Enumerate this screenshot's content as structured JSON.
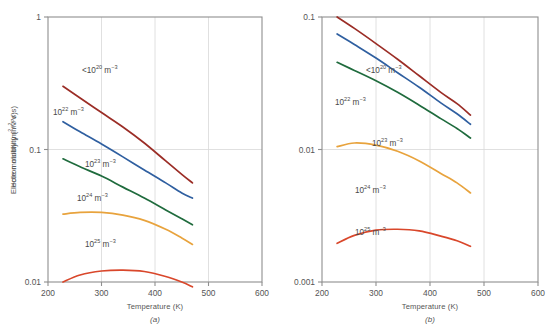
{
  "figure": {
    "panels": [
      {
        "id": "a",
        "caption": "(a)",
        "ylabel": "Electron mobility (m2/V·s)",
        "xlabel": "Temperature (K)"
      },
      {
        "id": "b",
        "caption": "(b)",
        "ylabel": "Hole mobility (m2/V·s)",
        "xlabel": "Temperature (K)"
      }
    ]
  },
  "chart_data": [
    {
      "type": "line",
      "panel": "a",
      "title": "Electron mobility vs Temperature",
      "xlabel": "Temperature (K)",
      "ylabel": "Electron mobility (m2/V·s)",
      "xlim": [
        200,
        600
      ],
      "ylim": [
        0.01,
        1
      ],
      "yscale": "log",
      "xticks": [
        200,
        300,
        400,
        500,
        600
      ],
      "xtick_labels": [
        "200",
        "300",
        "400",
        "500",
        "600"
      ],
      "yticks": [
        0.01,
        0.1,
        1
      ],
      "ytick_labels": [
        "0.01",
        "0.1",
        "1"
      ],
      "grid": true,
      "legend": "inline-annotations",
      "series": [
        {
          "name": "<10^20 m^-3",
          "label_html": "&lt;10<sup>20</sup> m<sup>−3</sup>",
          "color": "#9b2d26",
          "x": [
            228,
            260,
            300,
            340,
            380,
            420,
            450,
            470
          ],
          "y": [
            0.3,
            0.245,
            0.19,
            0.148,
            0.112,
            0.082,
            0.065,
            0.056
          ]
        },
        {
          "name": "10^22 m^-3",
          "label_html": "10<sup>22</sup> m<sup>−3</sup>",
          "color": "#2f5fa0",
          "x": [
            228,
            260,
            300,
            340,
            380,
            420,
            450,
            470
          ],
          "y": [
            0.162,
            0.136,
            0.11,
            0.088,
            0.07,
            0.056,
            0.047,
            0.043
          ]
        },
        {
          "name": "10^23 m^-3",
          "label_html": "10<sup>23</sup> m<sup>−3</sup>",
          "color": "#1f6b3d",
          "x": [
            228,
            260,
            300,
            340,
            380,
            420,
            450,
            470
          ],
          "y": [
            0.085,
            0.074,
            0.063,
            0.052,
            0.043,
            0.035,
            0.03,
            0.027
          ]
        },
        {
          "name": "10^24 m^-3",
          "label_html": "10<sup>24</sup> m<sup>−3</sup>",
          "color": "#e8a33d",
          "x": [
            228,
            260,
            300,
            340,
            380,
            420,
            450,
            470
          ],
          "y": [
            0.0325,
            0.0335,
            0.0335,
            0.032,
            0.0292,
            0.025,
            0.0215,
            0.0192
          ]
        },
        {
          "name": "10^25 m^-3",
          "label_html": "10<sup>25</sup> m<sup>−3</sup>",
          "color": "#d9472b",
          "x": [
            228,
            260,
            300,
            340,
            380,
            420,
            450,
            470
          ],
          "y": [
            0.01,
            0.0113,
            0.0121,
            0.0123,
            0.012,
            0.011,
            0.01,
            0.0092
          ]
        }
      ]
    },
    {
      "type": "line",
      "panel": "b",
      "title": "Hole mobility vs Temperature",
      "xlabel": "Temperature (K)",
      "ylabel": "Hole mobility (m2/V·s)",
      "xlim": [
        200,
        600
      ],
      "ylim": [
        0.001,
        0.1
      ],
      "yscale": "log",
      "xticks": [
        200,
        300,
        400,
        500,
        600
      ],
      "xtick_labels": [
        "200",
        "300",
        "400",
        "500",
        "600"
      ],
      "yticks": [
        0.001,
        0.01,
        0.1
      ],
      "ytick_labels": [
        "0.001",
        "0.01",
        "0.1"
      ],
      "grid": true,
      "legend": "inline-annotations",
      "series": [
        {
          "name": "<10^20 m^-3",
          "label_html": "&lt;10<sup>20</sup> m<sup>−3</sup>",
          "color": "#9b2d26",
          "x": [
            228,
            260,
            300,
            340,
            380,
            420,
            450,
            475
          ],
          "y": [
            0.1,
            0.082,
            0.063,
            0.048,
            0.036,
            0.027,
            0.0222,
            0.0182
          ]
        },
        {
          "name": "10^22 m^-3",
          "label_html": "10<sup>22</sup> m<sup>−3</sup>",
          "color": "#2f5fa0",
          "x": [
            228,
            260,
            300,
            340,
            380,
            420,
            450,
            475
          ],
          "y": [
            0.0745,
            0.062,
            0.049,
            0.038,
            0.0295,
            0.0225,
            0.0186,
            0.0155
          ]
        },
        {
          "name": "10^23 m^-3",
          "label_html": "10<sup>23</sup> m<sup>−3</sup>",
          "color": "#1f6b3d",
          "x": [
            228,
            260,
            300,
            340,
            380,
            420,
            450,
            475
          ],
          "y": [
            0.0455,
            0.0395,
            0.033,
            0.027,
            0.0216,
            0.0171,
            0.0144,
            0.0122
          ]
        },
        {
          "name": "10^24 m^-3",
          "label_html": "10<sup>24</sup> m<sup>−3</sup>",
          "color": "#e8a33d",
          "x": [
            228,
            260,
            300,
            340,
            380,
            420,
            450,
            475
          ],
          "y": [
            0.0105,
            0.0112,
            0.0108,
            0.0097,
            0.0082,
            0.0066,
            0.0056,
            0.0047
          ]
        },
        {
          "name": "10^25 m^-3",
          "label_html": "10<sup>25</sup> m<sup>−3</sup>",
          "color": "#d9472b",
          "x": [
            228,
            260,
            300,
            340,
            380,
            420,
            450,
            475
          ],
          "y": [
            0.00196,
            0.00225,
            0.00246,
            0.0025,
            0.00243,
            0.00222,
            0.00205,
            0.00186
          ]
        }
      ]
    }
  ],
  "annotations": {
    "a": [
      {
        "name": "label-n-lt-1e20",
        "html": "&lt;10<sup>20</sup> m<sup>−3</sup>",
        "x": 82,
        "y": 66
      },
      {
        "name": "label-n-1e22",
        "html": "10<sup>22</sup> m<sup>−3</sup>",
        "x": 53,
        "y": 108
      },
      {
        "name": "label-n-1e23",
        "html": "10<sup>23</sup> m<sup>−3</sup>",
        "x": 85,
        "y": 160
      },
      {
        "name": "label-n-1e24",
        "html": "10<sup>24</sup> m<sup>−3</sup>",
        "x": 77,
        "y": 194
      },
      {
        "name": "label-n-1e25",
        "html": "10<sup>25</sup> m<sup>−3</sup>",
        "x": 85,
        "y": 240
      }
    ],
    "b": [
      {
        "name": "label-p-lt-1e20",
        "html": "&lt;10<sup>20</sup> m<sup>−3</sup>",
        "x": 366,
        "y": 66
      },
      {
        "name": "label-p-1e22",
        "html": "10<sup>22</sup> m<sup>−3</sup>",
        "x": 335,
        "y": 98
      },
      {
        "name": "label-p-1e23",
        "html": "10<sup>23</sup> m<sup>−3</sup>",
        "x": 372,
        "y": 139
      },
      {
        "name": "label-p-1e24",
        "html": "10<sup>24</sup> m<sup>−3</sup>",
        "x": 355,
        "y": 186
      },
      {
        "name": "label-p-1e25",
        "html": "10<sup>25</sup> m<sup>−3</sup>",
        "x": 355,
        "y": 228
      }
    ]
  },
  "style": {
    "frame_color": "#8f8f8f",
    "grid_color": "#d8d8d8",
    "text_color": "#555555",
    "background": "#ffffff"
  },
  "geometry": {
    "a": {
      "left": 48,
      "right": 262,
      "top": 17,
      "bottom": 282
    },
    "b": {
      "left": 322,
      "right": 538,
      "top": 17,
      "bottom": 282
    }
  }
}
